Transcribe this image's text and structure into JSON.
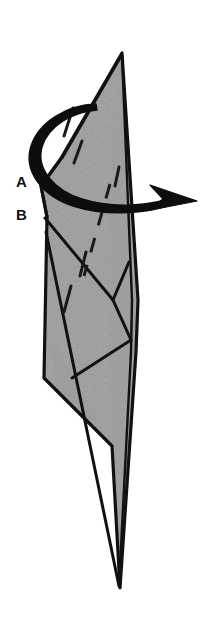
{
  "figure": {
    "kind": "origami-fold-diagram",
    "background_color": "#ffffff",
    "paper_fill_color": "#a9a9a9",
    "paper_fill_shade_color": "#9e9e9e",
    "outline_color": "#111111",
    "arrow_color": "#0d0d0d"
  },
  "labels": [
    {
      "id": "A",
      "text": "A",
      "x": 16,
      "y": 174
    },
    {
      "id": "B",
      "text": "B",
      "x": 16,
      "y": 207
    }
  ],
  "annotations": {
    "rotation_arrow": {
      "name": "rotate-arrow",
      "description": "thick curved loop arrow encircling the model, arrowhead pointing right",
      "head_tip": {
        "x": 197,
        "y": 201
      }
    },
    "valley_fold_dashed_line": {
      "name": "valley-fold-dashed",
      "description": "dashed diagonal fold line running from upper right to lower left",
      "from": {
        "x": 110,
        "y": 184
      },
      "to": {
        "x": 84,
        "y": 276
      }
    },
    "crease_tick_marks": [
      {
        "from": {
          "x": 73,
          "y": 108
        },
        "to": {
          "x": 64,
          "y": 136
        }
      },
      {
        "from": {
          "x": 82,
          "y": 141
        },
        "to": {
          "x": 74,
          "y": 163
        }
      },
      {
        "from": {
          "x": 119,
          "y": 168
        },
        "to": {
          "x": 115,
          "y": 186
        }
      },
      {
        "from": {
          "x": 86,
          "y": 253
        },
        "to": {
          "x": 80,
          "y": 276
        }
      },
      {
        "from": {
          "x": 71,
          "y": 286
        },
        "to": {
          "x": 64,
          "y": 312
        }
      }
    ]
  },
  "geometry": {
    "paper_outline": "M122,53 L141,303 L139,352 L120,588 L112,444 L44,378 L47,216 L41,185 L60,160 Z",
    "top_point": {
      "x": 122,
      "y": 53
    },
    "bottom_point": {
      "x": 120,
      "y": 588
    },
    "point_a": {
      "x": 41,
      "y": 186
    },
    "point_b": {
      "x": 43,
      "y": 216
    }
  }
}
